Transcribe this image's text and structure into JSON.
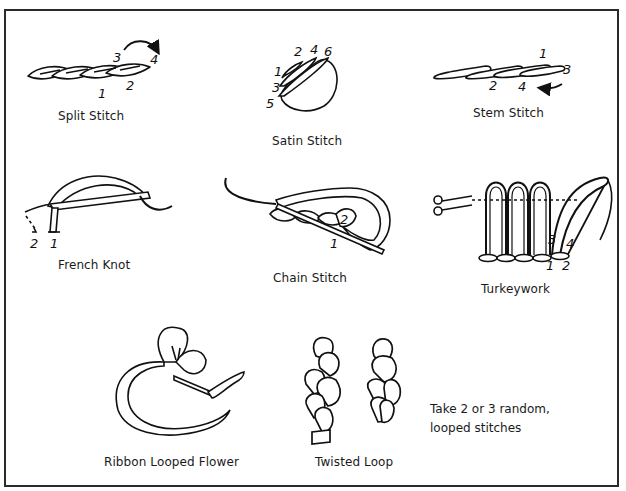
{
  "figure": {
    "title": "",
    "type": "embroidery stitch reference diagram",
    "colors": {
      "ink": "#111111",
      "border": "#2a2a2a",
      "background": "#ffffff"
    }
  },
  "stitches": [
    {
      "id": "split-stitch",
      "label": "Split Stitch",
      "step_numbers": [
        "1",
        "2",
        "3",
        "4"
      ]
    },
    {
      "id": "satin-stitch",
      "label": "Satin Stitch",
      "step_numbers": [
        "1",
        "2",
        "3",
        "4",
        "5",
        "6"
      ]
    },
    {
      "id": "stem-stitch",
      "label": "Stem Stitch",
      "step_numbers": [
        "1",
        "2",
        "3",
        "4"
      ]
    },
    {
      "id": "french-knot",
      "label": "French Knot",
      "step_numbers": [
        "1",
        "2"
      ]
    },
    {
      "id": "chain-stitch",
      "label": "Chain Stitch",
      "step_numbers": [
        "1",
        "2"
      ]
    },
    {
      "id": "turkeywork",
      "label": "Turkeywork",
      "step_numbers": [
        "1",
        "2",
        "3",
        "4"
      ]
    },
    {
      "id": "ribbon-looped-flower",
      "label": "Ribbon Looped Flower",
      "step_numbers": []
    },
    {
      "id": "twisted-loop",
      "label": "Twisted Loop",
      "step_numbers": []
    }
  ],
  "notes": {
    "twisted_loop_line1": "Take 2 or 3 random,",
    "twisted_loop_line2": "looped stitches"
  },
  "numbers": {
    "split": {
      "n1": "1",
      "n2": "2",
      "n3": "3",
      "n4": "4"
    },
    "satin": {
      "n1": "1",
      "n2": "2",
      "n3": "3",
      "n4": "4",
      "n5": "5",
      "n6": "6"
    },
    "stem": {
      "n1": "1",
      "n2": "2",
      "n3": "3",
      "n4": "4"
    },
    "french": {
      "n1": "1",
      "n2": "2"
    },
    "chain": {
      "n1": "1",
      "n2": "2"
    },
    "turkey": {
      "n1": "1",
      "n2": "2",
      "n3": "3",
      "n4": "4"
    }
  }
}
